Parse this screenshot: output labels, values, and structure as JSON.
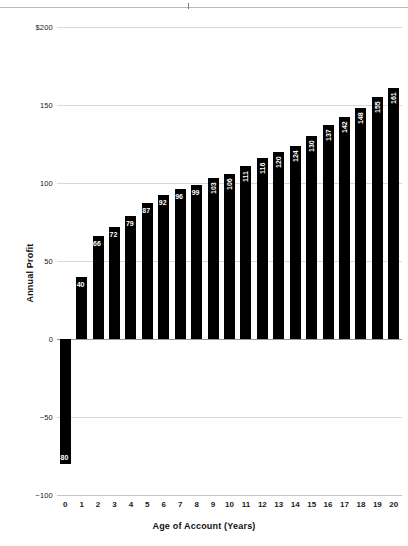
{
  "chart_data": {
    "type": "bar",
    "title": "",
    "xlabel": "Age of Account (Years)",
    "ylabel": "Annual Profit",
    "categories": [
      "0",
      "1",
      "2",
      "3",
      "4",
      "5",
      "6",
      "7",
      "8",
      "9",
      "10",
      "11",
      "12",
      "13",
      "14",
      "15",
      "16",
      "17",
      "18",
      "19",
      "20"
    ],
    "values": [
      -80,
      40,
      66,
      72,
      79,
      87,
      92,
      96,
      99,
      103,
      106,
      111,
      116,
      120,
      124,
      130,
      137,
      142,
      148,
      155,
      161
    ],
    "data_labels": [
      "-80",
      "40",
      "66",
      "72",
      "79",
      "87",
      "92",
      "96",
      "99",
      "103",
      "106",
      "111",
      "116",
      "120",
      "124",
      "130",
      "137",
      "142",
      "148",
      "155",
      "161"
    ],
    "ylim": [
      -100,
      200
    ],
    "xlim": [
      -0.5,
      20.5
    ],
    "y_ticks": [
      200,
      150,
      100,
      50,
      0,
      -50,
      -100
    ],
    "y_tick_labels": [
      "$200",
      "150",
      "100",
      "50",
      "0",
      "−50",
      "−100"
    ],
    "grid": true,
    "legend": null,
    "bar_color": "#000000",
    "label_color": "#ffffff",
    "grid_color": "#d8d8d8",
    "axis_color": "#9a9a9a"
  }
}
